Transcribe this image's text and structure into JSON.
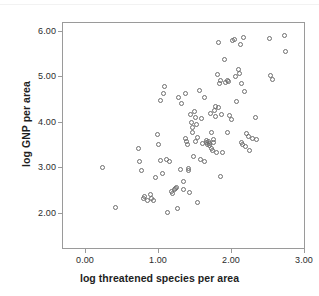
{
  "chart_data": {
    "type": "scatter",
    "title": "",
    "xlabel": "log threatened species per area",
    "ylabel": "log GNP per area",
    "xlim": [
      -0.15,
      3.3
    ],
    "ylim": [
      1.72,
      6.2
    ],
    "xticks": [
      0.0,
      1.0,
      2.0,
      3.0
    ],
    "yticks": [
      2.0,
      3.0,
      4.0,
      5.0,
      6.0
    ],
    "xticklabels": [
      "0.00",
      "1.00",
      "2.00",
      "3.00"
    ],
    "yticklabels": [
      "2.00",
      "3.00",
      "4.00",
      "5.00",
      "6.00"
    ],
    "grid": false,
    "legend": null,
    "marker": "open-circle",
    "marker_color": "#6e6e6e",
    "frame_color": "#9a9a9a",
    "n_points": 112,
    "points": [
      [
        0.42,
        3.33
      ],
      [
        0.6,
        2.52
      ],
      [
        0.93,
        3.7
      ],
      [
        0.95,
        3.45
      ],
      [
        0.97,
        3.26
      ],
      [
        1.0,
        2.7
      ],
      [
        1.02,
        2.74
      ],
      [
        1.06,
        2.67
      ],
      [
        1.1,
        2.79
      ],
      [
        1.12,
        2.71
      ],
      [
        1.14,
        2.67
      ],
      [
        1.18,
        3.12
      ],
      [
        1.2,
        3.98
      ],
      [
        1.22,
        3.79
      ],
      [
        1.24,
        4.66
      ],
      [
        1.25,
        3.46
      ],
      [
        1.27,
        3.2
      ],
      [
        1.29,
        4.79
      ],
      [
        1.31,
        4.93
      ],
      [
        1.33,
        3.48
      ],
      [
        1.34,
        2.43
      ],
      [
        1.37,
        3.44
      ],
      [
        1.4,
        2.84
      ],
      [
        1.42,
        2.8
      ],
      [
        1.44,
        2.88
      ],
      [
        1.46,
        2.9
      ],
      [
        1.48,
        2.93
      ],
      [
        1.49,
        2.51
      ],
      [
        1.51,
        4.71
      ],
      [
        1.53,
        3.28
      ],
      [
        1.55,
        4.6
      ],
      [
        1.57,
        3.04
      ],
      [
        1.58,
        2.88
      ],
      [
        1.6,
        4.8
      ],
      [
        1.61,
        3.91
      ],
      [
        1.62,
        3.84
      ],
      [
        1.63,
        3.79
      ],
      [
        1.64,
        3.3
      ],
      [
        1.65,
        3.27
      ],
      [
        1.66,
        2.82
      ],
      [
        1.68,
        4.38
      ],
      [
        1.69,
        4.22
      ],
      [
        1.7,
        4.11
      ],
      [
        1.71,
        4.02
      ],
      [
        1.72,
        3.55
      ],
      [
        1.73,
        4.44
      ],
      [
        1.74,
        4.31
      ],
      [
        1.75,
        3.85
      ],
      [
        1.76,
        4.18
      ],
      [
        1.77,
        3.92
      ],
      [
        1.78,
        2.63
      ],
      [
        1.8,
        4.85
      ],
      [
        1.82,
        3.48
      ],
      [
        1.83,
        4.3
      ],
      [
        1.85,
        3.8
      ],
      [
        1.87,
        3.44
      ],
      [
        1.88,
        4.72
      ],
      [
        1.9,
        3.86
      ],
      [
        1.91,
        3.82
      ],
      [
        1.92,
        3.79
      ],
      [
        1.93,
        3.84
      ],
      [
        1.94,
        3.81
      ],
      [
        1.95,
        3.76
      ],
      [
        1.96,
        4.4
      ],
      [
        1.97,
        3.7
      ],
      [
        1.98,
        4.02
      ],
      [
        1.99,
        3.66
      ],
      [
        2.0,
        3.83
      ],
      [
        2.01,
        3.88
      ],
      [
        2.02,
        4.46
      ],
      [
        2.03,
        4.54
      ],
      [
        2.04,
        4.33
      ],
      [
        2.05,
        3.62
      ],
      [
        2.06,
        5.18
      ],
      [
        2.07,
        5.81
      ],
      [
        2.08,
        4.52
      ],
      [
        2.09,
        5.0
      ],
      [
        2.1,
        3.15
      ],
      [
        2.11,
        5.05
      ],
      [
        2.12,
        4.37
      ],
      [
        2.14,
        3.62
      ],
      [
        2.16,
        5.48
      ],
      [
        2.18,
        5.02
      ],
      [
        2.2,
        5.06
      ],
      [
        2.21,
        4.02
      ],
      [
        2.22,
        5.04
      ],
      [
        2.24,
        4.35
      ],
      [
        2.26,
        4.28
      ],
      [
        2.28,
        5.86
      ],
      [
        2.3,
        5.88
      ],
      [
        2.32,
        5.14
      ],
      [
        2.34,
        4.64
      ],
      [
        2.36,
        5.28
      ],
      [
        2.38,
        5.19
      ],
      [
        2.39,
        5.78
      ],
      [
        2.4,
        4.99
      ],
      [
        2.41,
        3.82
      ],
      [
        2.42,
        3.79
      ],
      [
        2.44,
        5.92
      ],
      [
        2.45,
        4.83
      ],
      [
        2.46,
        3.74
      ],
      [
        2.48,
        3.99
      ],
      [
        2.5,
        3.94
      ],
      [
        2.52,
        3.67
      ],
      [
        2.56,
        3.9
      ],
      [
        2.6,
        4.31
      ],
      [
        2.62,
        3.88
      ],
      [
        2.8,
        5.89
      ],
      [
        2.82,
        5.15
      ],
      [
        2.85,
        5.08
      ],
      [
        3.02,
        5.95
      ],
      [
        3.04,
        5.63
      ]
    ]
  }
}
